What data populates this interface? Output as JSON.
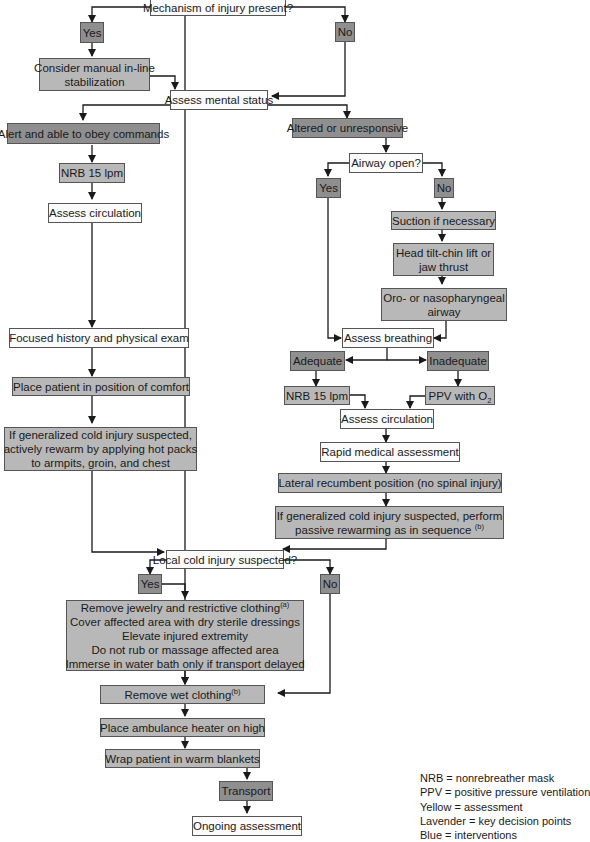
{
  "flowchart": {
    "nodes": {
      "mechanism": "Mechanism of injury present?",
      "mech_yes": "Yes",
      "mech_no": "No",
      "inline_stab_1": "Consider manual in-line",
      "inline_stab_2": "stabilization",
      "mental_status": "Assess mental status",
      "alert": "Alert and able to obey commands",
      "altered": "Altered or unresponsive",
      "nrb_left": "NRB 15 lpm",
      "assess_circ_left": "Assess circulation",
      "airway_open": "Airway open?",
      "airway_yes": "Yes",
      "airway_no": "No",
      "suction": "Suction if necessary",
      "head_tilt_1": "Head tilt-chin lift or",
      "head_tilt_2": "jaw thrust",
      "oro_1": "Oro- or nasopharyngeal",
      "oro_2": "airway",
      "assess_breathing": "Assess breathing",
      "adequate": "Adequate",
      "inadequate": "Inadequate",
      "nrb_right": "NRB 15 lpm",
      "ppv": "PPV with O",
      "ppv_sub": "2",
      "assess_circ_right": "Assess circulation",
      "rapid_medical": "Rapid medical assessment",
      "lateral": "Lateral recumbent position (no spinal injury)",
      "passive_1": "If generalized cold injury suspected, perform",
      "passive_2": "passive rewarming as in sequence ",
      "passive_sup": "(b)",
      "focused_history": "Focused history and physical exam",
      "position_comfort": "Place patient in position of comfort",
      "active_1": "If generalized cold injury suspected,",
      "active_2": "actively rewarm by applying hot packs",
      "active_3": "to armpits, groin, and chest",
      "local_cold": "Local cold injury suspected?",
      "local_yes": "Yes",
      "local_no": "No",
      "local_care_1": "Remove jewelry and restrictive clothing",
      "local_care_1_sup": "(a)",
      "local_care_2": "Cover affected area with dry sterile dressings",
      "local_care_3": "Elevate injured extremity",
      "local_care_4": "Do not rub or massage affected area",
      "local_care_5": "Immerse in water bath only if transport delayed",
      "remove_wet": "Remove wet clothing",
      "remove_wet_sup": "(b)",
      "heater": "Place ambulance heater on high",
      "wrap": "Wrap patient in warm blankets",
      "transport": "Transport",
      "ongoing": "Ongoing assessment"
    },
    "legend": [
      "NRB = nonrebreather mask",
      "PPV = positive pressure ventilation",
      "Yellow = assessment",
      "Lavender = key decision points",
      "Blue = interventions"
    ],
    "colors": {
      "assessment": "#fbfbfb",
      "decision": "#8f8f8f",
      "intervention": "#b8b8b8",
      "line": "#1a1a1a"
    }
  }
}
